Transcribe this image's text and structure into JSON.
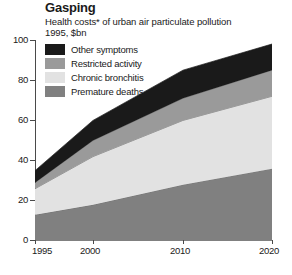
{
  "header": {
    "title": "Gasping",
    "subtitle": "Health costs* of urban air particulate pollution",
    "subtitle_note": "*",
    "subtitle2": "1995, $bn"
  },
  "legend": {
    "position": "top-left-inside-plot",
    "items": [
      {
        "label": "Other symptoms",
        "color": "#1a1a1a"
      },
      {
        "label": "Restricted activity",
        "color": "#9a9a9a"
      },
      {
        "label": "Chronic bronchitis",
        "color": "#e2e2e2"
      },
      {
        "label": "Premature deaths",
        "color": "#808080"
      }
    ]
  },
  "axes": {
    "y_ticks": [
      "100",
      "80",
      "60",
      "40",
      "20",
      "0"
    ],
    "x_ticks": [
      "1995",
      "2000",
      "2010",
      "2020"
    ]
  },
  "chart_data": {
    "type": "area",
    "title": "Gasping",
    "subtitle": "Health costs* of urban air particulate pollution",
    "xlabel": "",
    "ylabel": "1995, $bn",
    "stacked": true,
    "grid": false,
    "legend_position": "top-left",
    "x": [
      1995,
      2000,
      2010,
      2020
    ],
    "xtick_labels": [
      "1995",
      "2000",
      "2010",
      "2020"
    ],
    "xlim": [
      1995,
      2020
    ],
    "ylim": [
      0,
      100
    ],
    "ytick_labels": [
      "0",
      "20",
      "40",
      "60",
      "80",
      "100"
    ],
    "series": [
      {
        "name": "Premature deaths",
        "color": "#808080",
        "values": [
          13,
          18,
          28,
          36
        ]
      },
      {
        "name": "Chronic bronchitis",
        "color": "#e2e2e2",
        "values": [
          13,
          24,
          32,
          36
        ]
      },
      {
        "name": "Restricted activity",
        "color": "#9a9a9a",
        "values": [
          3,
          8,
          11,
          13
        ]
      },
      {
        "name": "Other symptoms",
        "color": "#1a1a1a",
        "values": [
          6,
          10,
          14,
          13
        ]
      }
    ],
    "cumulative_tops": {
      "Premature deaths": [
        13,
        18,
        28,
        36
      ],
      "Chronic bronchitis": [
        26,
        42,
        60,
        72
      ],
      "Restricted activity": [
        29,
        50,
        71,
        85
      ],
      "Other symptoms": [
        35,
        60,
        85,
        98
      ]
    }
  }
}
